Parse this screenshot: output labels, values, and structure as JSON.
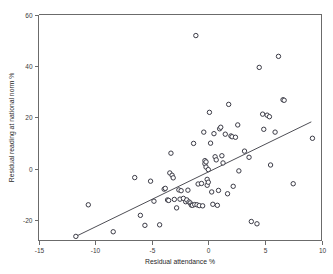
{
  "chart_data": {
    "type": "scatter",
    "title": "",
    "xlabel": "Residual attendance %",
    "ylabel": "Residual reading at national norm %",
    "xlim": [
      -15,
      10
    ],
    "ylim": [
      -28,
      60
    ],
    "xticks": [
      -15,
      -10,
      -5,
      0,
      5,
      10
    ],
    "yticks": [
      -20,
      0,
      20,
      40,
      60
    ],
    "xtick_labels": [
      "-15",
      "-10",
      "-5",
      "0",
      "5",
      "10"
    ],
    "ytick_labels": [
      "-20",
      "0",
      "20",
      "40",
      "60"
    ],
    "grid": false,
    "legend": "none",
    "marker_style": "open-circle",
    "marker_color": "#3b3b46",
    "fit_line": {
      "label": "linear regression fit",
      "x_start": -11.7,
      "y_start": -26.4,
      "x_end": 9.1,
      "y_end": 18.2,
      "color": "#3a3a42"
    },
    "points": [
      [
        -11.7,
        -26.4
      ],
      [
        -10.6,
        -14.1
      ],
      [
        -8.4,
        -24.6
      ],
      [
        -6.5,
        -3.5
      ],
      [
        -6.0,
        -18.2
      ],
      [
        -5.6,
        -22.1
      ],
      [
        -5.1,
        -4.9
      ],
      [
        -4.8,
        -12.7
      ],
      [
        -4.3,
        -21.9
      ],
      [
        -3.9,
        -8.0
      ],
      [
        -3.8,
        -7.7
      ],
      [
        -3.6,
        -12.2
      ],
      [
        -3.5,
        -12.4
      ],
      [
        -3.4,
        -1.7
      ],
      [
        -3.2,
        -2.6
      ],
      [
        -3.1,
        -3.6
      ],
      [
        -3.3,
        6.0
      ],
      [
        -3.0,
        -12.0
      ],
      [
        -2.8,
        -15.3
      ],
      [
        -2.6,
        -8.3
      ],
      [
        -2.5,
        -11.9
      ],
      [
        -2.4,
        -8.6
      ],
      [
        -2.2,
        -11.6
      ],
      [
        -2.0,
        -12.9
      ],
      [
        -1.9,
        -12.2
      ],
      [
        -1.8,
        -8.4
      ],
      [
        -1.7,
        -13.0
      ],
      [
        -1.6,
        -13.4
      ],
      [
        -1.5,
        -14.2
      ],
      [
        -1.4,
        -14.3
      ],
      [
        -1.3,
        9.8
      ],
      [
        -1.2,
        -14.0
      ],
      [
        -1.1,
        51.8
      ],
      [
        -1.0,
        -14.1
      ],
      [
        -0.9,
        -6.0
      ],
      [
        -0.8,
        -14.4
      ],
      [
        -0.6,
        -5.8
      ],
      [
        -0.5,
        -14.5
      ],
      [
        -0.4,
        14.2
      ],
      [
        -0.3,
        3.1
      ],
      [
        -0.3,
        1.9
      ],
      [
        -0.2,
        0.6
      ],
      [
        -0.2,
        2.6
      ],
      [
        -0.1,
        -4.2
      ],
      [
        -0.1,
        -6.5
      ],
      [
        0.0,
        -0.4
      ],
      [
        0.0,
        -5.3
      ],
      [
        0.1,
        21.9
      ],
      [
        0.2,
        9.9
      ],
      [
        0.3,
        -9.1
      ],
      [
        0.4,
        -13.9
      ],
      [
        0.5,
        13.6
      ],
      [
        0.6,
        4.6
      ],
      [
        0.7,
        3.4
      ],
      [
        0.8,
        -14.3
      ],
      [
        0.9,
        -8.5
      ],
      [
        1.0,
        15.5
      ],
      [
        1.1,
        16.1
      ],
      [
        1.2,
        5.0
      ],
      [
        1.3,
        2.2
      ],
      [
        1.5,
        13.4
      ],
      [
        1.7,
        -9.8
      ],
      [
        1.8,
        25.0
      ],
      [
        2.0,
        12.7
      ],
      [
        2.1,
        12.4
      ],
      [
        2.2,
        -6.9
      ],
      [
        2.4,
        12.2
      ],
      [
        2.6,
        17.0
      ],
      [
        2.7,
        -0.9
      ],
      [
        3.2,
        6.8
      ],
      [
        3.6,
        4.4
      ],
      [
        3.8,
        -20.6
      ],
      [
        4.3,
        -21.5
      ],
      [
        4.5,
        39.4
      ],
      [
        4.8,
        21.2
      ],
      [
        4.9,
        15.3
      ],
      [
        5.2,
        20.8
      ],
      [
        5.4,
        20.2
      ],
      [
        5.5,
        1.4
      ],
      [
        5.9,
        14.2
      ],
      [
        6.2,
        43.7
      ],
      [
        6.6,
        26.8
      ],
      [
        6.7,
        26.6
      ],
      [
        7.5,
        -5.9
      ],
      [
        9.2,
        11.8
      ]
    ]
  }
}
